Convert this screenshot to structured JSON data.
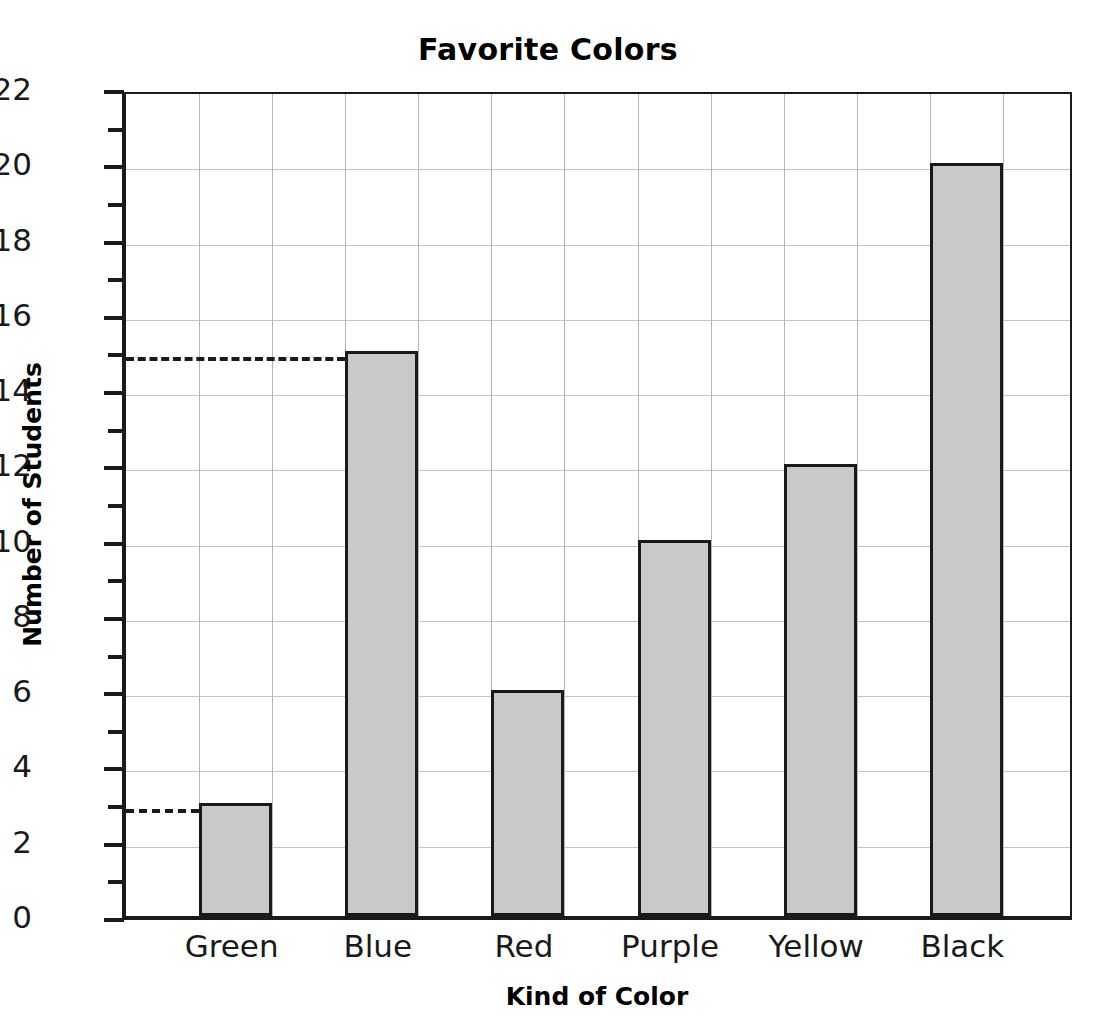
{
  "chart_data": {
    "type": "bar",
    "title": "Favorite Colors",
    "xlabel": "Kind of Color",
    "ylabel": "Number of Students",
    "categories": [
      "Green",
      "Blue",
      "Red",
      "Purple",
      "Yellow",
      "Black"
    ],
    "values": [
      3,
      15,
      6,
      10,
      12,
      20
    ],
    "ylim": [
      0,
      22
    ],
    "y_major_step": 2,
    "y_minor_step": 1,
    "y_tick_labels": [
      "0",
      "2",
      "4",
      "6",
      "8",
      "10",
      "12",
      "14",
      "16",
      "18",
      "20",
      "22"
    ],
    "grid": true,
    "legend": "none",
    "annotations": [
      {
        "type": "dashed-reference-line",
        "y": 3,
        "to_category": "Green"
      },
      {
        "type": "dashed-reference-line",
        "y": 15,
        "to_category": "Blue"
      }
    ],
    "bar_fill_color": "#c9c9c9",
    "bar_outline_color": "#1a1a1a",
    "grid_color": "#c4c4c4",
    "axis_color": "#1a1a1a",
    "background_color": "#ffffff"
  }
}
